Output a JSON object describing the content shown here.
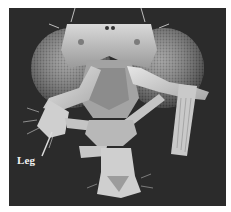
{
  "image": {
    "subject": "Scanning electron micrograph of fruit fly head with legs in place of antennae",
    "background_color": "#2b2b2b",
    "page_color": "#ffffff"
  },
  "annotations": [
    {
      "id": "leg",
      "label": "Leg"
    }
  ]
}
